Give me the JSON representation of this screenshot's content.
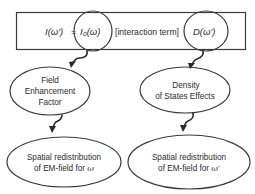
{
  "equation": {
    "lhs": "I(ω′)",
    "equals": "=",
    "term1": "I₀(ω)",
    "middle": "[interaction term]",
    "term2": "D(ω′)"
  },
  "nodes": {
    "field_enhancement": {
      "line1": "Field",
      "line2": "Enhancement",
      "line3": "Factor"
    },
    "density_of_states": {
      "line1": "Density",
      "line2": "of States Effects"
    },
    "spatial_omega": {
      "line1": "Spatial redistribution",
      "line2_prefix": "of EM-field for ",
      "line2_symbol": "ω"
    },
    "spatial_omega_prime": {
      "line1": "Spatial redistribution",
      "line2_prefix": "of EM-field for ",
      "line2_symbol": "ω′"
    }
  },
  "edges": [
    {
      "from": "term1",
      "to": "field_enhancement"
    },
    {
      "from": "term2",
      "to": "density_of_states"
    },
    {
      "from": "field_enhancement",
      "to": "spatial_omega"
    },
    {
      "from": "density_of_states",
      "to": "spatial_omega_prime"
    }
  ],
  "colors": {
    "stroke": "#3a3a3a",
    "text": "#2b2b2b",
    "background": "#ffffff"
  }
}
